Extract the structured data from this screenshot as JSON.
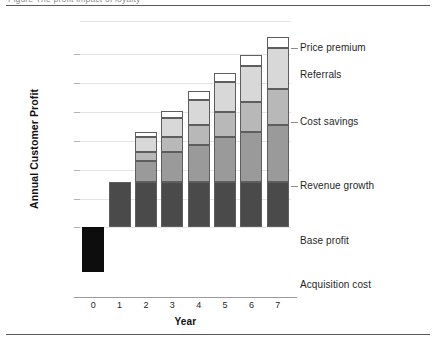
{
  "figure": {
    "caption_clipped": "Figure  The profit impact of loyalty",
    "top_rule": true,
    "bottom_rule": true
  },
  "axes": {
    "ylabel": "Annual Customer Profit",
    "xlabel": "Year",
    "xticks": [
      "0",
      "1",
      "2",
      "3",
      "4",
      "5",
      "6",
      "7"
    ],
    "yticks_labeled": false,
    "gridlines": 6
  },
  "series_labels": [
    {
      "key": "price_premium",
      "label": "Price premium"
    },
    {
      "key": "referrals",
      "label": "Referrals"
    },
    {
      "key": "cost_savings",
      "label": "Cost savings"
    },
    {
      "key": "revenue_growth",
      "label": "Revenue growth"
    },
    {
      "key": "base_profit",
      "label": "Base profit"
    },
    {
      "key": "acquisition",
      "label": "Acquisition cost"
    }
  ],
  "colors": {
    "acquisition_cost": "#0d0d0d",
    "base_profit": "#4a4a4a",
    "revenue_growth": "#9a9a9a",
    "cost_savings": "#b8b8b8",
    "referrals": "#d8d8d8",
    "price_premium": "#ffffff",
    "segment_border": "#5e5e5e",
    "gridline": "#e4e4e4",
    "axis": "#9a9a9a",
    "rule": "#5a5a5a"
  },
  "chart_data": {
    "type": "bar",
    "title": "",
    "subtype": "stacked-bar",
    "xlabel": "Year",
    "ylabel": "Annual Customer Profit",
    "categories": [
      "0",
      "1",
      "2",
      "3",
      "4",
      "5",
      "6",
      "7"
    ],
    "ylim": [
      -30,
      100
    ],
    "grid": true,
    "legend_position": "right-inline-labels",
    "series": [
      {
        "name": "Acquisition cost",
        "values": [
          -25,
          0,
          0,
          0,
          0,
          0,
          0,
          0
        ]
      },
      {
        "name": "Base profit",
        "values": [
          0,
          25,
          25,
          25,
          25,
          25,
          25,
          25
        ]
      },
      {
        "name": "Revenue growth",
        "values": [
          0,
          0,
          12,
          17,
          21,
          25,
          28,
          32
        ]
      },
      {
        "name": "Cost savings",
        "values": [
          0,
          0,
          5,
          8,
          11,
          14,
          17,
          20
        ]
      },
      {
        "name": "Referrals",
        "values": [
          0,
          0,
          8,
          11,
          14,
          17,
          20,
          23
        ]
      },
      {
        "name": "Price premium",
        "values": [
          0,
          0,
          3,
          4,
          5,
          5,
          6,
          6
        ]
      }
    ],
    "totals": [
      -25,
      25,
      53,
      65,
      76,
      86,
      96,
      106
    ]
  }
}
